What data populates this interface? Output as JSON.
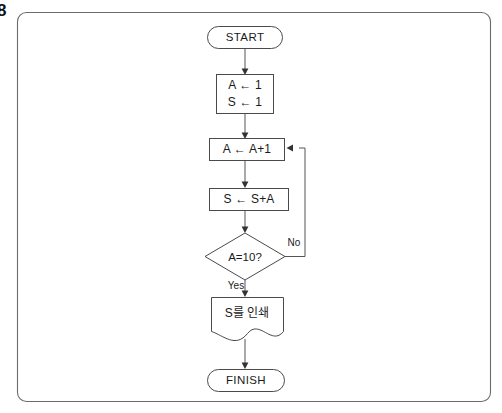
{
  "figure": {
    "label": "8"
  },
  "flowchart": {
    "title": "Sum accumulation flowchart",
    "nodes": [
      {
        "id": "start",
        "type": "terminator",
        "label": "START"
      },
      {
        "id": "init",
        "type": "process",
        "label_line1": "A ← 1",
        "label_line2": "S ← 1"
      },
      {
        "id": "incr_a",
        "type": "process",
        "label": "A ← A+1"
      },
      {
        "id": "add_s",
        "type": "process",
        "label": "S ← S+A"
      },
      {
        "id": "check",
        "type": "decision",
        "label": "A=10?"
      },
      {
        "id": "print_s",
        "type": "document",
        "label": "S를 인쇄"
      },
      {
        "id": "finish",
        "type": "terminator",
        "label": "FINISH"
      }
    ],
    "edge_labels": {
      "no": "No",
      "yes": "Yes"
    },
    "colors": {
      "shape_stroke": "#4a4a4a",
      "connector": "#555555",
      "text": "#1a1a1a",
      "frame": "#6b6b6b",
      "background": "#ffffff"
    }
  }
}
